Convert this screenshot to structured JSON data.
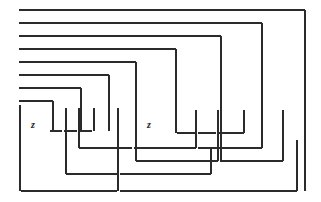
{
  "figure": {
    "width": 321,
    "height": 202,
    "background_color": "#ffffff",
    "line_color": "#2b2b2b",
    "line_width": 1.05,
    "label_color": "#1c1c1c"
  },
  "labels": [
    {
      "id": "label-z-left",
      "text": "z",
      "x": 33,
      "y": 126
    },
    {
      "id": "label-z-right",
      "text": "z",
      "x": 149,
      "y": 126
    }
  ],
  "chart_data": {
    "type": "table",
    "xlabel": "",
    "ylabel": "",
    "segment_columns": [
      "orientation",
      "x1",
      "y1",
      "x2",
      "y2"
    ],
    "horizontal_segments": [
      [
        "h",
        19,
        10,
        305,
        10
      ],
      [
        "h",
        19,
        23,
        262,
        23
      ],
      [
        "h",
        19,
        36,
        221,
        36
      ],
      [
        "h",
        19,
        49,
        176,
        49
      ],
      [
        "h",
        19,
        62,
        136,
        62
      ],
      [
        "h",
        19,
        75,
        109,
        75
      ],
      [
        "h",
        19,
        88,
        81,
        88
      ],
      [
        "h",
        19,
        101,
        53,
        101
      ],
      [
        "h",
        50,
        131,
        62,
        131
      ],
      [
        "h",
        64,
        131,
        77,
        131
      ],
      [
        "h",
        79,
        131,
        92,
        131
      ],
      [
        "h",
        177,
        133,
        196,
        133
      ],
      [
        "h",
        198,
        133,
        216,
        133
      ],
      [
        "h",
        218,
        133,
        244,
        133
      ],
      [
        "h",
        79,
        148,
        132,
        148
      ],
      [
        "h",
        134,
        148,
        196,
        148
      ],
      [
        "h",
        198,
        148,
        262,
        148
      ],
      [
        "h",
        136,
        161,
        218,
        161
      ],
      [
        "h",
        220,
        161,
        283,
        161
      ],
      [
        "h",
        66,
        174,
        118,
        174
      ],
      [
        "h",
        120,
        174,
        211,
        174
      ],
      [
        "h",
        21,
        191,
        117,
        191
      ],
      [
        "h",
        120,
        191,
        297,
        191
      ]
    ],
    "vertical_segments": [
      [
        "v",
        305,
        10,
        191,
        0
      ],
      [
        "v",
        262,
        23,
        148,
        0
      ],
      [
        "v",
        221,
        36,
        161,
        0
      ],
      [
        "v",
        176,
        49,
        133,
        0
      ],
      [
        "v",
        136,
        62,
        161,
        0
      ],
      [
        "v",
        109,
        75,
        131,
        0
      ],
      [
        "v",
        81,
        88,
        131,
        0
      ],
      [
        "v",
        53,
        101,
        131,
        0
      ],
      [
        "v",
        20,
        105,
        191,
        0
      ],
      [
        "v",
        66,
        108,
        174,
        0
      ],
      [
        "v",
        79,
        108,
        148,
        0
      ],
      [
        "v",
        94,
        108,
        131,
        0
      ],
      [
        "v",
        118,
        108,
        191,
        0
      ],
      [
        "v",
        196,
        110,
        148,
        0
      ],
      [
        "v",
        218,
        110,
        161,
        0
      ],
      [
        "v",
        244,
        110,
        133,
        0
      ],
      [
        "v",
        283,
        110,
        161,
        0
      ],
      [
        "v",
        211,
        148,
        174,
        0
      ],
      [
        "v",
        297,
        140,
        191,
        0
      ]
    ]
  }
}
